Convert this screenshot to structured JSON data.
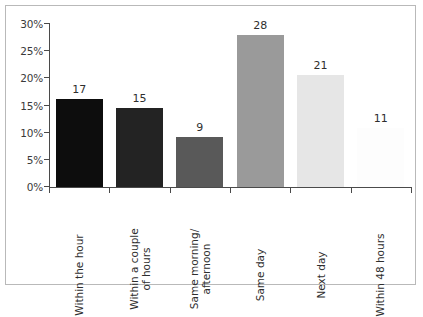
{
  "chart_data": {
    "type": "bar",
    "title": "",
    "subtitle": "",
    "xlabel": "",
    "ylabel": "",
    "categories": [
      "Within the hour",
      "Within a couple of hours",
      "Same morning/ afternoon",
      "Same day",
      "Next day",
      "Within 48 hours"
    ],
    "category_lines": [
      [
        "Within the hour"
      ],
      [
        "Within a couple",
        "of hours"
      ],
      [
        "Same morning/",
        "afternoon"
      ],
      [
        "Same day"
      ],
      [
        "Next day"
      ],
      [
        "Within 48 hours"
      ]
    ],
    "values": [
      17,
      15,
      9,
      28,
      21,
      11
    ],
    "value_labels": [
      "17",
      "15",
      "9",
      "28",
      "21",
      "11"
    ],
    "bar_percent_heights": [
      16.2,
      14.6,
      9.2,
      27.9,
      20.6,
      10.9
    ],
    "bar_colors": [
      "#0d0d0d",
      "#232323",
      "#595959",
      "#9a9a9a",
      "#e6e6e6",
      "#fdfdfd"
    ],
    "ytick_labels": [
      "0%",
      "5%",
      "10%",
      "15%",
      "20%",
      "25%",
      "30%"
    ],
    "ytick_values": [
      0,
      5,
      10,
      15,
      20,
      25,
      30
    ],
    "ylim": [
      0,
      30
    ],
    "grid": false,
    "legend": false,
    "legend_position": "none",
    "axis_color": "#4a4a4a",
    "frame_color": "#b9b9b9",
    "background": "#ffffff",
    "label_rotation": 90
  }
}
